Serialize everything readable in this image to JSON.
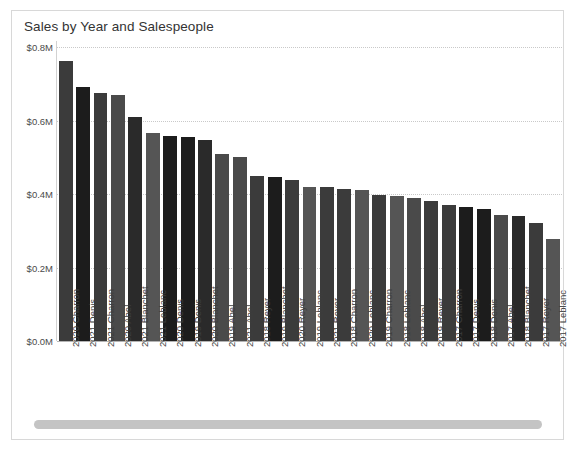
{
  "chart_data": {
    "type": "bar",
    "title": "Sales by Year and Salespeople",
    "xlabel": "",
    "ylabel": "",
    "ylim": [
      0,
      0.8
    ],
    "y_ticks": [
      "$0.0M",
      "$0.2M",
      "$0.4M",
      "$0.6M",
      "$0.8M"
    ],
    "y_tick_values": [
      0.0,
      0.2,
      0.4,
      0.6,
      0.8
    ],
    "grid": true,
    "legend": "none",
    "value_unit": "millions of dollars",
    "categories": [
      "2020 Charron",
      "2021 Denis",
      "2021 Charron",
      "2020 Abel",
      "2021 Blanchet",
      "2021 Leblanc",
      "2020 Denis",
      "2019 Denis",
      "2020 Blanchet",
      "2019 Abel",
      "2021 Abel",
      "2018 Reyer",
      "2019 Blanchet",
      "2020 Reyer",
      "2019 Leblanc",
      "2021 Reyer",
      "2018 Charron",
      "2020 Leblanc",
      "2019 Charron",
      "2018 Leblanc",
      "2018 Abel",
      "2019 Reyer",
      "2017 Charron",
      "2017 Denis",
      "2018 Denis",
      "2017 Abel",
      "2018 Blanchet",
      "2017 Reyer",
      "2017 Leblanc"
    ],
    "values": [
      0.762,
      0.69,
      0.676,
      0.67,
      0.61,
      0.565,
      0.558,
      0.555,
      0.548,
      0.508,
      0.5,
      0.448,
      0.446,
      0.437,
      0.42,
      0.418,
      0.415,
      0.412,
      0.398,
      0.395,
      0.39,
      0.38,
      0.371,
      0.365,
      0.36,
      0.342,
      0.34,
      0.322,
      0.277
    ],
    "bar_colors": [
      "#3b3b3b",
      "#1c1c1c",
      "#3b3b3b",
      "#4a4a4a",
      "#2a2a2a",
      "#555555",
      "#1c1c1c",
      "#1c1c1c",
      "#2a2a2a",
      "#4a4a4a",
      "#4a4a4a",
      "#3b3b3b",
      "#1c1c1c",
      "#3b3b3b",
      "#555555",
      "#3b3b3b",
      "#3b3b3b",
      "#555555",
      "#3b3b3b",
      "#555555",
      "#4a4a4a",
      "#3b3b3b",
      "#3b3b3b",
      "#1c1c1c",
      "#1c1c1c",
      "#4a4a4a",
      "#2a2a2a",
      "#3b3b3b",
      "#555555"
    ]
  },
  "scrollbar": {
    "orientation": "horizontal",
    "thumb_fraction": 1.0
  }
}
